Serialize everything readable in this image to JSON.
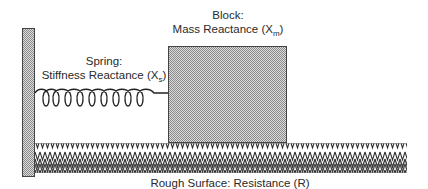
{
  "diagram": {
    "wall": {
      "label": ""
    },
    "spring": {
      "heading": "Spring:",
      "label": "Stiffness Reactance (X",
      "subscript": "s",
      "suffix": ")",
      "coil_count": 9
    },
    "block": {
      "heading": "Block:",
      "label": "Mass Reactance (X",
      "subscript": "m",
      "suffix": ")"
    },
    "surface": {
      "label": "Rough Surface: Resistance (R)"
    },
    "colors": {
      "stroke": "#333333",
      "fill_dots": "#9a9a9a",
      "fill_bg": "#d8d8d8",
      "zigzag": "#2e2e2e"
    }
  }
}
